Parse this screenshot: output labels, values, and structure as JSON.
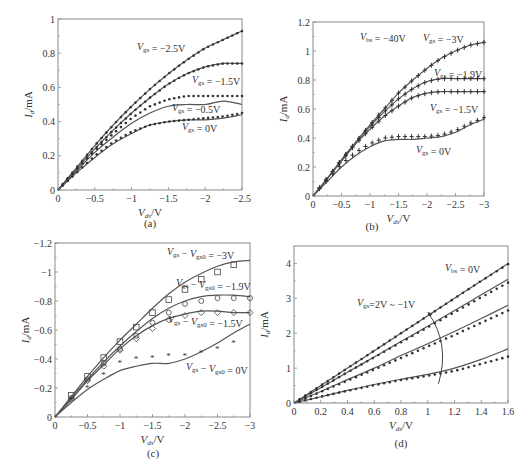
{
  "figure": {
    "panels": [
      "(a)",
      "(b)",
      "(c)",
      "(d)"
    ]
  },
  "chart_data": [
    {
      "id": "a",
      "type": "line",
      "subtitle": "(a)",
      "xlabel": "V_ds / V",
      "ylabel": "I_d / mA",
      "xlim": [
        0,
        -2.5
      ],
      "ylim": [
        0,
        1
      ],
      "xticks": [
        "0",
        "-0.5",
        "-1",
        "-1.5",
        "-2",
        "-2.5"
      ],
      "yticks": [
        "0",
        "0.2",
        "0.4",
        "0.6",
        "0.8",
        "1"
      ],
      "grid": false,
      "legend": "inline annotations",
      "annotations": [
        "V_gs = -2.5V",
        "V_gs = -1.5V",
        "V_gs = -0.5V",
        "V_gs = 0V"
      ],
      "x": [
        0,
        -0.25,
        -0.5,
        -0.75,
        -1,
        -1.25,
        -1.5,
        -1.75,
        -2,
        -2.25,
        -2.5
      ],
      "series": [
        {
          "name": "V_gs = -2.5V",
          "fit": [
            0,
            0.13,
            0.26,
            0.38,
            0.49,
            0.59,
            0.68,
            0.76,
            0.83,
            0.88,
            0.93
          ],
          "measured": [
            0,
            0.13,
            0.26,
            0.38,
            0.49,
            0.59,
            0.68,
            0.76,
            0.83,
            0.88,
            0.93
          ]
        },
        {
          "name": "V_gs = -1.5V",
          "fit": [
            0,
            0.12,
            0.24,
            0.35,
            0.45,
            0.54,
            0.62,
            0.68,
            0.72,
            0.74,
            0.74
          ],
          "measured": [
            0,
            0.12,
            0.24,
            0.35,
            0.45,
            0.54,
            0.62,
            0.68,
            0.72,
            0.74,
            0.74
          ]
        },
        {
          "name": "V_gs = -0.5V",
          "fit": [
            0,
            0.11,
            0.22,
            0.31,
            0.39,
            0.45,
            0.49,
            0.5,
            0.5,
            0.52,
            0.5
          ],
          "measured": [
            0,
            0.12,
            0.23,
            0.33,
            0.42,
            0.49,
            0.53,
            0.55,
            0.55,
            0.55,
            0.55
          ]
        },
        {
          "name": "V_gs = 0V",
          "fit": [
            0,
            0.1,
            0.19,
            0.27,
            0.33,
            0.38,
            0.4,
            0.41,
            0.41,
            0.42,
            0.44
          ],
          "measured": [
            0,
            0.1,
            0.2,
            0.28,
            0.34,
            0.38,
            0.4,
            0.41,
            0.42,
            0.43,
            0.45
          ]
        }
      ]
    },
    {
      "id": "b",
      "type": "line",
      "subtitle": "(b)",
      "xlabel": "V_ds / V",
      "ylabel": "I_d / mA",
      "xlim": [
        0,
        -3
      ],
      "ylim": [
        0,
        1.2
      ],
      "xticks": [
        "0",
        "-0.5",
        "-1",
        "-1.5",
        "-2",
        "-2.5",
        "-3"
      ],
      "yticks": [
        "0",
        "0.2",
        "0.4",
        "0.6",
        "0.8",
        "1",
        "1.2"
      ],
      "grid": false,
      "legend": "inline annotations",
      "annotations": [
        "V_bs = -40V",
        "V_gs = -3V",
        "V_gs = -1.9V",
        "V_gs = -1.5V",
        "V_gs = 0V"
      ],
      "x": [
        0,
        -0.25,
        -0.5,
        -0.75,
        -1,
        -1.25,
        -1.5,
        -1.75,
        -2,
        -2.25,
        -2.5,
        -2.75,
        -3
      ],
      "series": [
        {
          "name": "V_gs = -3V",
          "fit": [
            0,
            0.12,
            0.25,
            0.37,
            0.49,
            0.6,
            0.71,
            0.8,
            0.88,
            0.95,
            1.0,
            1.04,
            1.06
          ],
          "measured": [
            0,
            0.12,
            0.25,
            0.37,
            0.49,
            0.6,
            0.71,
            0.8,
            0.88,
            0.95,
            1.0,
            1.04,
            1.06
          ]
        },
        {
          "name": "V_gs = -1.9V",
          "fit": [
            0,
            0.12,
            0.25,
            0.37,
            0.48,
            0.58,
            0.67,
            0.74,
            0.79,
            0.81,
            0.81,
            0.81,
            0.81
          ],
          "measured": [
            0,
            0.12,
            0.25,
            0.37,
            0.48,
            0.58,
            0.67,
            0.74,
            0.79,
            0.81,
            0.81,
            0.81,
            0.81
          ]
        },
        {
          "name": "V_gs = -1.5V",
          "fit": [
            0,
            0.12,
            0.24,
            0.36,
            0.46,
            0.55,
            0.62,
            0.68,
            0.71,
            0.72,
            0.72,
            0.72,
            0.72
          ],
          "measured": [
            0,
            0.12,
            0.24,
            0.36,
            0.46,
            0.55,
            0.62,
            0.68,
            0.71,
            0.72,
            0.72,
            0.72,
            0.72
          ]
        },
        {
          "name": "V_gs = 0V",
          "fit": [
            0,
            0.1,
            0.2,
            0.28,
            0.34,
            0.38,
            0.39,
            0.39,
            0.4,
            0.41,
            0.44,
            0.49,
            0.53
          ],
          "measured": [
            0,
            0.11,
            0.22,
            0.3,
            0.36,
            0.4,
            0.41,
            0.41,
            0.41,
            0.42,
            0.45,
            0.5,
            0.54
          ]
        }
      ]
    },
    {
      "id": "c",
      "type": "line",
      "subtitle": "(c)",
      "xlabel": "V_ds / V",
      "ylabel": "I_d / mA",
      "xlim": [
        0,
        -3
      ],
      "ylim": [
        0,
        -1.2
      ],
      "xticks": [
        "0",
        "-0.5",
        "-1",
        "-1.5",
        "-2",
        "-2.5",
        "-3"
      ],
      "yticks": [
        "0",
        "-0.2",
        "-0.4",
        "-0.6",
        "-0.8",
        "-1",
        "-1.2"
      ],
      "grid": false,
      "legend": "inline annotations",
      "annotations": [
        "V_gs - V_gs0 = -3V",
        "V_gs - V_gs0 = -1.9V",
        "V_gs - V_gs0 = -1.5V",
        "V_gs - V_gs0 = 0V"
      ],
      "x": [
        0,
        -0.25,
        -0.5,
        -0.75,
        -1,
        -1.25,
        -1.5,
        -1.75,
        -2,
        -2.25,
        -2.5,
        -2.75,
        -3
      ],
      "series": [
        {
          "name": "V_gs - V_gs0 = -3V",
          "marker": "square",
          "fit": [
            0,
            -0.14,
            -0.28,
            -0.41,
            -0.53,
            -0.64,
            -0.75,
            -0.85,
            -0.93,
            -0.99,
            -1.04,
            -1.07,
            -1.08
          ],
          "measured": [
            0,
            -0.15,
            -0.28,
            -0.41,
            -0.52,
            -0.62,
            -0.72,
            -0.81,
            -0.88,
            -0.95,
            -1.0,
            -1.05,
            null
          ]
        },
        {
          "name": "V_gs - V_gs0 = -1.9V",
          "marker": "circle",
          "fit": [
            0,
            -0.13,
            -0.26,
            -0.38,
            -0.49,
            -0.59,
            -0.68,
            -0.75,
            -0.8,
            -0.83,
            -0.84,
            -0.84,
            -0.83
          ],
          "measured": [
            0,
            -0.13,
            -0.26,
            -0.37,
            -0.47,
            -0.56,
            -0.65,
            -0.72,
            -0.78,
            -0.8,
            -0.82,
            -0.82,
            -0.82
          ]
        },
        {
          "name": "V_gs - V_gs0 = -1.5V",
          "marker": "diamond",
          "fit": [
            0,
            -0.12,
            -0.25,
            -0.36,
            -0.47,
            -0.56,
            -0.63,
            -0.68,
            -0.71,
            -0.73,
            -0.73,
            -0.72,
            -0.72
          ],
          "measured": [
            0,
            -0.12,
            -0.25,
            -0.35,
            -0.46,
            -0.54,
            -0.61,
            -0.67,
            -0.7,
            -0.72,
            -0.72,
            -0.72,
            -0.72
          ]
        },
        {
          "name": "V_gs - V_gs0 = 0V",
          "marker": "star",
          "fit": [
            0,
            -0.1,
            -0.19,
            -0.26,
            -0.32,
            -0.35,
            -0.37,
            -0.37,
            -0.4,
            -0.45,
            -0.51,
            -0.58,
            -0.64
          ],
          "measured": [
            0,
            -0.12,
            -0.2,
            -0.29,
            -0.37,
            -0.4,
            -0.41,
            -0.42,
            -0.42,
            -0.44,
            -0.47,
            -0.51,
            null
          ]
        }
      ]
    },
    {
      "id": "d",
      "type": "line",
      "subtitle": "(d)",
      "xlabel": "V_ds / V",
      "ylabel": "I_d / mA",
      "xlim": [
        0,
        1.6
      ],
      "ylim": [
        0,
        4.5
      ],
      "xticks": [
        "0",
        "0.2",
        "0.4",
        "0.6",
        "0.8",
        "1",
        "1.2",
        "1.4",
        "1.6"
      ],
      "yticks": [
        "0",
        "1",
        "2",
        "3",
        "4"
      ],
      "grid": false,
      "legend": "inline annotations",
      "annotations": [
        "V_bs = 0V",
        "V_gs=2V ~ -1V"
      ],
      "x": [
        0,
        0.2,
        0.4,
        0.6,
        0.8,
        1.0,
        1.2,
        1.4,
        1.6
      ],
      "series": [
        {
          "name": "V_gs = 2V",
          "fit": [
            0,
            0.5,
            1.0,
            1.5,
            2.0,
            2.5,
            3.0,
            3.5,
            4.0
          ],
          "measured": [
            0,
            0.5,
            1.0,
            1.5,
            2.0,
            2.5,
            3.0,
            3.5,
            3.98
          ]
        },
        {
          "name": "V_gs = 1V",
          "fit": [
            0,
            0.44,
            0.88,
            1.32,
            1.76,
            2.2,
            2.65,
            3.1,
            3.55
          ],
          "measured": [
            0,
            0.44,
            0.88,
            1.31,
            1.74,
            2.17,
            2.6,
            3.03,
            3.45
          ]
        },
        {
          "name": "V_gs = 0V",
          "fit": [
            0,
            0.33,
            0.67,
            1.0,
            1.36,
            1.7,
            2.05,
            2.42,
            2.8
          ],
          "measured": [
            0,
            0.32,
            0.64,
            0.96,
            1.29,
            1.62,
            1.95,
            2.3,
            2.65
          ]
        },
        {
          "name": "V_gs = -1V",
          "fit": [
            0,
            0.18,
            0.36,
            0.53,
            0.68,
            0.82,
            1.0,
            1.25,
            1.55
          ],
          "measured": [
            0,
            0.18,
            0.35,
            0.51,
            0.66,
            0.78,
            0.92,
            1.12,
            1.33
          ]
        }
      ]
    }
  ]
}
